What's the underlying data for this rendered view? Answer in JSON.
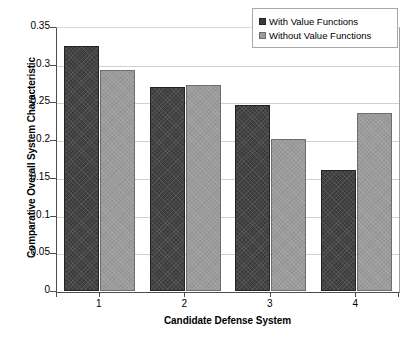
{
  "chart_data": {
    "type": "bar",
    "title": "",
    "xlabel": "Candidate Defense System",
    "ylabel": "Comparative Overall System Characteristic",
    "categories": [
      "1",
      "2",
      "3",
      "4"
    ],
    "series": [
      {
        "name": "With Value Functions",
        "color": "#3b3b3b",
        "values": [
          0.325,
          0.27,
          0.246,
          0.161
        ]
      },
      {
        "name": "Without Value Functions",
        "color": "#9b9b9b",
        "values": [
          0.293,
          0.273,
          0.201,
          0.236
        ]
      }
    ],
    "ylim": [
      0,
      0.35
    ],
    "ytick_labels": [
      "0",
      "0.05",
      "0.1",
      "0.15",
      "0.2",
      "0.25",
      "0.3",
      "0.35"
    ],
    "ytick_values": [
      0,
      0.05,
      0.1,
      0.15,
      0.2,
      0.25,
      0.3,
      0.35
    ],
    "grid": true,
    "legend_position": "top-right"
  },
  "legend": {
    "entries": [
      {
        "label": "With Value Functions",
        "swatch": "dark"
      },
      {
        "label": "Without Value Functions",
        "swatch": "light"
      }
    ]
  },
  "caption": {
    "partial_text": ""
  }
}
